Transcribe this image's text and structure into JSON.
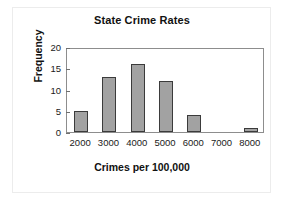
{
  "chart_data": {
    "type": "bar",
    "title": "State Crime Rates",
    "xlabel": "Crimes per 100,000",
    "ylabel": "Frequency",
    "categories": [
      "2000",
      "3000",
      "4000",
      "5000",
      "6000",
      "7000",
      "8000"
    ],
    "values": [
      5,
      13,
      16,
      12,
      4,
      0,
      1
    ],
    "xtick_labels": [
      "2000",
      "3000",
      "4000",
      "5000",
      "6000",
      "7000",
      "8000"
    ],
    "ytick_labels": [
      "0",
      "5",
      "10",
      "15",
      "20"
    ],
    "ylim": [
      0,
      20
    ],
    "grid": false,
    "legend": null,
    "bar_color": "#a2a2a2",
    "bar_border_color": "#3b3b3b",
    "axis_color": "#8d8d8d",
    "text_color": "#111111"
  },
  "yticks": [
    {
      "label": "20",
      "value": 20
    },
    {
      "label": "15",
      "value": 15
    },
    {
      "label": "10",
      "value": 10
    },
    {
      "label": "5",
      "value": 5
    },
    {
      "label": "0",
      "value": 0
    }
  ],
  "bars": [
    {
      "category": "2000",
      "value": 5
    },
    {
      "category": "3000",
      "value": 13
    },
    {
      "category": "4000",
      "value": 16
    },
    {
      "category": "5000",
      "value": 12
    },
    {
      "category": "6000",
      "value": 4
    },
    {
      "category": "7000",
      "value": 0
    },
    {
      "category": "8000",
      "value": 1
    }
  ]
}
